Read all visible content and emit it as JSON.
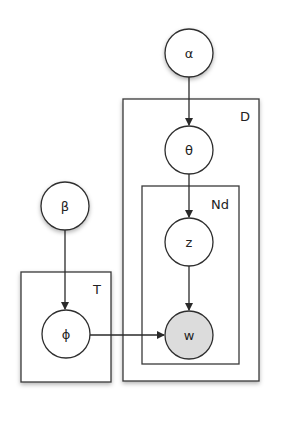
{
  "diagram": {
    "type": "plate-notation",
    "nodes": [
      {
        "id": "alpha",
        "label": "α",
        "observed": false
      },
      {
        "id": "theta",
        "label": "θ",
        "observed": false
      },
      {
        "id": "z",
        "label": "z",
        "observed": false
      },
      {
        "id": "w",
        "label": "w",
        "observed": true
      },
      {
        "id": "beta",
        "label": "β",
        "observed": false
      },
      {
        "id": "phi",
        "label": "ϕ",
        "observed": false
      }
    ],
    "plates": [
      {
        "id": "D",
        "label": "D",
        "contains": [
          "theta",
          "Nd"
        ]
      },
      {
        "id": "Nd",
        "label": "Nd",
        "contains": [
          "z",
          "w"
        ]
      },
      {
        "id": "T",
        "label": "T",
        "contains": [
          "phi"
        ]
      }
    ],
    "edges": [
      {
        "from": "alpha",
        "to": "theta"
      },
      {
        "from": "theta",
        "to": "z"
      },
      {
        "from": "z",
        "to": "w"
      },
      {
        "from": "beta",
        "to": "phi"
      },
      {
        "from": "phi",
        "to": "w"
      }
    ],
    "colors": {
      "observed_fill": "#dcdcdc",
      "latent_fill": "#ffffff",
      "stroke": "#2e2e2e"
    }
  }
}
